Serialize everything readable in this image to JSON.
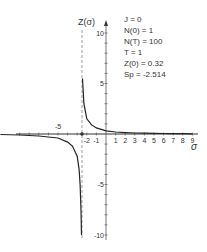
{
  "chart_data": {
    "type": "line",
    "title": "",
    "xlabel": "σ",
    "ylabel": "Z(σ)",
    "xlim": [
      -11,
      9.5
    ],
    "ylim": [
      -10,
      10.5
    ],
    "x_ticks_labeled": [
      -5,
      -2,
      -1,
      1,
      2,
      3,
      4,
      5,
      6,
      7,
      8,
      9
    ],
    "y_ticks_labeled": [
      10,
      5,
      -5,
      -10
    ],
    "grid": false,
    "legend": "none",
    "asymptote": {
      "x": -2.514,
      "style": "dashed",
      "label": "S_p"
    },
    "series": [
      {
        "name": "Z(σ) right branch",
        "x": [
          -2.45,
          -2.3,
          -2.0,
          -1.5,
          -1.0,
          0,
          1,
          2,
          3,
          4,
          5,
          6,
          7,
          8,
          9
        ],
        "y": [
          5.5,
          3.0,
          1.5,
          0.9,
          0.6,
          0.32,
          0.2,
          0.14,
          0.1,
          0.08,
          0.06,
          0.05,
          0.04,
          0.03,
          0.02
        ]
      },
      {
        "name": "Z(σ) left branch",
        "x": [
          -11,
          -9,
          -7,
          -5,
          -4,
          -3.5,
          -3,
          -2.8,
          -2.7,
          -2.6,
          -2.55
        ],
        "y": [
          -0.05,
          -0.1,
          -0.2,
          -0.4,
          -0.8,
          -1.2,
          -2.2,
          -3.5,
          -5,
          -7.5,
          -10
        ]
      }
    ],
    "annotations": [
      "J = 0",
      "N(0) = 1",
      "N(T) = 100",
      "T = 1",
      "Z(0) = 0.32",
      "Sp = -2.514"
    ]
  },
  "axes": {
    "y_label": "Z(σ)",
    "x_label": "σ",
    "x_tick_labels": [
      "-5",
      "-2",
      "-1",
      "1",
      "2",
      "3",
      "4",
      "5",
      "6",
      "7",
      "8",
      "9"
    ],
    "y_tick_labels": [
      "10",
      "5",
      "-5",
      "-10"
    ]
  },
  "params": [
    "J = 0",
    "N(0) = 1",
    "N(T) = 100",
    "T = 1",
    "Z(0) = 0.32",
    "Sp = -2.514"
  ]
}
